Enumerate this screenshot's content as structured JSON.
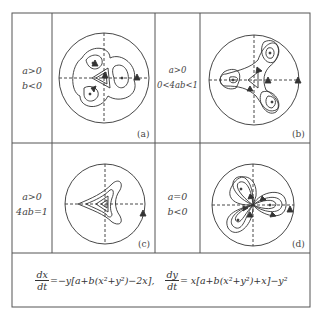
{
  "figure": {
    "panels": [
      {
        "id": "a",
        "label": "(a)",
        "conditions": [
          "a>0",
          "b<0"
        ]
      },
      {
        "id": "b",
        "label": "(b)",
        "conditions": [
          "a>0",
          "0<4ab<1"
        ]
      },
      {
        "id": "c",
        "label": "(c)",
        "conditions": [
          "a>0",
          "4ab=1"
        ]
      },
      {
        "id": "d",
        "label": "(d)",
        "conditions": [
          "a=0",
          "b<0"
        ]
      }
    ],
    "equation": {
      "dx_num": "dx",
      "dx_den": "dt",
      "dx_rhs": "=−y[a+b(x²+y²)−2x],",
      "dy_num": "dy",
      "dy_den": "dt",
      "dy_rhs": "= x[a+b(x²+y²)+x]−y²"
    }
  }
}
